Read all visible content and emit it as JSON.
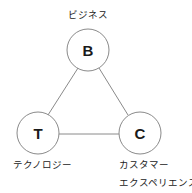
{
  "diagram": {
    "title": "",
    "colors": {
      "stroke": "#8a8a8a",
      "fill": "#ffffff",
      "text": "#1a1a1a"
    },
    "nodes": [
      {
        "id": "B",
        "letter": "B",
        "label_lines": [
          "ビジネス"
        ],
        "meaning": "business"
      },
      {
        "id": "T",
        "letter": "T",
        "label_lines": [
          "テクノロジー"
        ],
        "meaning": "technology"
      },
      {
        "id": "C",
        "letter": "C",
        "label_lines": [
          "カスタマー",
          "エクスペリエンス"
        ],
        "meaning": "customer experience"
      }
    ],
    "edges": [
      {
        "from": "B",
        "to": "T"
      },
      {
        "from": "B",
        "to": "C"
      },
      {
        "from": "T",
        "to": "C"
      }
    ]
  }
}
